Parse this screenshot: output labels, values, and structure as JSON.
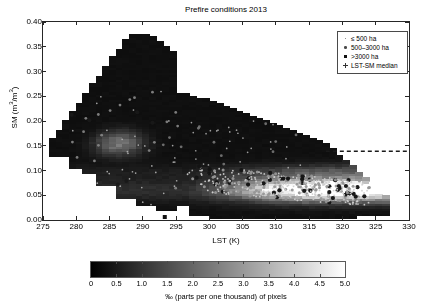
{
  "chart_data": {
    "type": "heatmap",
    "title": "Prefire conditions 2013",
    "xlabel": "LST (K)",
    "ylabel_text": "SM (m3/m3)",
    "ylabel_prefix": "SM (m",
    "ylabel_sup1": "3",
    "ylabel_mid": "/m",
    "ylabel_sup2": "3",
    "ylabel_suffix": ")",
    "xlim": [
      275,
      330
    ],
    "ylim": [
      0.0,
      0.4
    ],
    "xticks": [
      "275",
      "280",
      "285",
      "290",
      "295",
      "300",
      "305",
      "310",
      "315",
      "320",
      "325",
      "330"
    ],
    "xtick_values": [
      275,
      280,
      285,
      290,
      295,
      300,
      305,
      310,
      315,
      320,
      325,
      330
    ],
    "yticks": [
      "0.00",
      "0.05",
      "0.10",
      "0.15",
      "0.20",
      "0.25",
      "0.30",
      "0.35",
      "0.40"
    ],
    "ytick_values": [
      0.0,
      0.05,
      0.1,
      0.15,
      0.2,
      0.25,
      0.3,
      0.35,
      0.4
    ],
    "grid": false,
    "colormap": "gray",
    "colorbar": {
      "label": "‰ (parts per one thousand) of pixels",
      "min": 0,
      "max": 5.0,
      "ticks": [
        "0",
        "0.5",
        "1.0",
        "1.5",
        "2.0",
        "2.5",
        "3.0",
        "3.5",
        "4.0",
        "4.5",
        "5.0"
      ],
      "tick_values": [
        0,
        0.5,
        1.0,
        1.5,
        2.0,
        2.5,
        3.0,
        3.5,
        4.0,
        4.5,
        5.0
      ],
      "low_color": "#000000",
      "high_color": "#ffffff"
    },
    "legend": {
      "position": "upper-right",
      "entries": [
        {
          "label": "≤ 500 ha",
          "marker": "small-dot"
        },
        {
          "label": "500–3000 ha",
          "marker": "medium-dot"
        },
        {
          "label": ">3000 ha",
          "marker": "large-square"
        },
        {
          "label": "LST-SM median",
          "marker": "plus"
        }
      ]
    },
    "median_line": {
      "label": "LST-SM median",
      "style": "dashed",
      "y_value": 0.139,
      "x_start": 317.5,
      "x_end": 330.0,
      "color": "#1a1a1a"
    },
    "density_cells": [
      {
        "x": 276.5,
        "y": 0.145,
        "v": 0.35
      },
      {
        "x": 276.5,
        "y": 0.155,
        "v": 0.3
      },
      {
        "x": 277.5,
        "y": 0.135,
        "v": 0.4
      },
      {
        "x": 277.5,
        "y": 0.165,
        "v": 0.35
      },
      {
        "x": 279.5,
        "y": 0.175,
        "v": 0.45
      },
      {
        "x": 281.5,
        "y": 0.2,
        "v": 0.5
      },
      {
        "x": 283.5,
        "y": 0.24,
        "v": 0.5
      },
      {
        "x": 285.5,
        "y": 0.29,
        "v": 0.45
      },
      {
        "x": 287.5,
        "y": 0.33,
        "v": 0.4
      },
      {
        "x": 289.5,
        "y": 0.355,
        "v": 0.3
      },
      {
        "x": 286.0,
        "y": 0.155,
        "v": 1.55
      },
      {
        "x": 287.0,
        "y": 0.16,
        "v": 1.9
      },
      {
        "x": 288.0,
        "y": 0.155,
        "v": 1.5
      },
      {
        "x": 285.0,
        "y": 0.15,
        "v": 1.1
      },
      {
        "x": 289.0,
        "y": 0.15,
        "v": 0.95
      },
      {
        "x": 305.0,
        "y": 0.075,
        "v": 2.4
      },
      {
        "x": 308.0,
        "y": 0.07,
        "v": 3.0
      },
      {
        "x": 311.0,
        "y": 0.065,
        "v": 3.5
      },
      {
        "x": 314.0,
        "y": 0.065,
        "v": 4.1
      },
      {
        "x": 317.0,
        "y": 0.06,
        "v": 4.6
      },
      {
        "x": 320.0,
        "y": 0.06,
        "v": 4.9
      },
      {
        "x": 322.5,
        "y": 0.06,
        "v": 4.3
      },
      {
        "x": 324.0,
        "y": 0.055,
        "v": 3.2
      },
      {
        "x": 302.0,
        "y": 0.08,
        "v": 1.7
      },
      {
        "x": 299.0,
        "y": 0.085,
        "v": 1.2
      }
    ],
    "scatter_note": "fire locations overlaid as grey/white points, dense cluster near LST 298-322 K and SM 0.04-0.12"
  }
}
